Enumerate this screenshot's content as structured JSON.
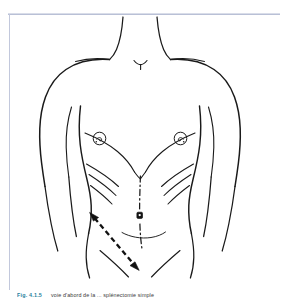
{
  "page": {
    "background_color": "#ffffff",
    "frame_color": "#b9c0d6"
  },
  "figure": {
    "line_color": "#1a1a1a",
    "incision_marker": {
      "name": "subcostal-incision-arrow",
      "style": "dashed-double-arrow",
      "color": "#111111",
      "side": "left"
    },
    "landmarks": [
      "neck",
      "clavicle-left",
      "clavicle-right",
      "shoulder-left",
      "shoulder-right",
      "nipple-left",
      "nipple-right",
      "costal-margin-left",
      "costal-margin-right",
      "linea-alba",
      "umbilicus",
      "inguinal-crease-left",
      "inguinal-crease-right"
    ]
  },
  "caption": {
    "fig_number": "Fig. 4.1.5",
    "text": "voie d'abord de la ... splénectomie simple",
    "fig_number_color": "#1f7f9c",
    "text_color": "#3a3a3a"
  }
}
